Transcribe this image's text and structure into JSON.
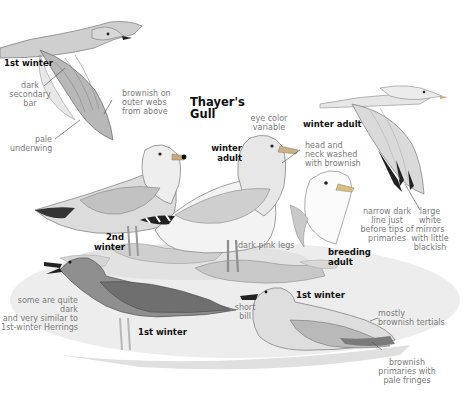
{
  "plate": {
    "title": "Thayer's\nGull",
    "colors": {
      "background": "#ffffff",
      "ink": "#111111",
      "annotation": "#7a7a7a",
      "ground": "#e6e6e6",
      "plumage_light": "#d9d9d9",
      "plumage_mid": "#b5b5b5",
      "plumage_dark": "#5a5a5a"
    }
  },
  "birds": [
    {
      "id": "first-winter-flight",
      "age_label": "1st winter"
    },
    {
      "id": "winter-adult-flight",
      "age_label": "winter adult"
    },
    {
      "id": "second-winter-standing",
      "age_label": "2nd\nwinter"
    },
    {
      "id": "winter-adult-standing",
      "age_label": "winter\nadult"
    },
    {
      "id": "breeding-adult-head",
      "age_label": "breeding\nadult"
    },
    {
      "id": "first-winter-standing",
      "age_label": "1st winter"
    },
    {
      "id": "first-winter-resting",
      "age_label": "1st winter"
    }
  ],
  "annotations": {
    "dark_secondary_bar": "dark secondary\nbar",
    "brownish_outer_webs": "brownish on\nouter webs\nfrom above",
    "pale_underwing": "pale\nunderwing",
    "eye_color": "eye color\nvariable",
    "head_neck_washed": "head and\nneck washed\nwith brownish",
    "narrow_dark_line": "narrow dark\nline just\nbefore tips of\nprimaries",
    "large_white_mirrors": "large\nwhite\nmirrors\nwith little\nblackish",
    "dark_pink_legs": "dark pink legs",
    "some_quite_dark": "some are quite dark\nand very similar to\n1st-winter Herrings",
    "short_bill": "short\nbill",
    "mostly_brownish_tertials": "mostly\nbrownish tertials",
    "brownish_primaries": "brownish\nprimaries with\npale fringes"
  }
}
